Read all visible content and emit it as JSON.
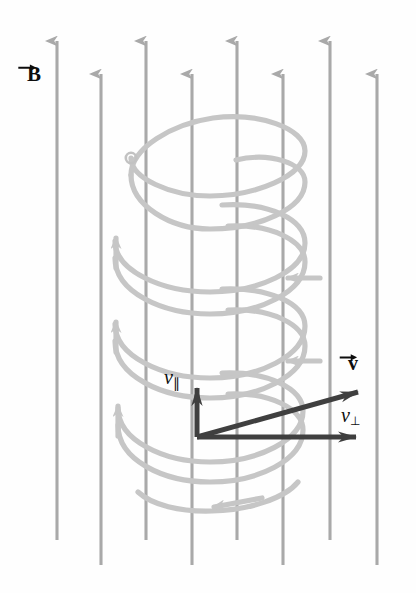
{
  "figure": {
    "background_color": "#fefefe"
  },
  "labels": {
    "magnetic_field": "B",
    "velocity": "v",
    "velocity_parallel_base": "v",
    "velocity_parallel_sub": "∥",
    "velocity_perp_base": "v",
    "velocity_perp_sub": "⊥"
  },
  "colors": {
    "field_line": "#a9a9a9",
    "helix": "#c6c6c6",
    "vector": "#3f3f3f",
    "label": "#0d0d0d",
    "particle": "#c2c2c2"
  },
  "field_lines": {
    "count": 8,
    "direction": "up",
    "x_positions": [
      57,
      101,
      146,
      192,
      237,
      283,
      330,
      377
    ],
    "tops": [
      35,
      68,
      35,
      68,
      35,
      68,
      35,
      68
    ],
    "bottoms": [
      540,
      565,
      540,
      565,
      540,
      565,
      540,
      565
    ]
  },
  "helix": {
    "turns": 4,
    "center_x": 210,
    "radius_x": 95,
    "radius_y": 30,
    "top_y": 175,
    "pitch": 83,
    "particle_dot": {
      "x": 131,
      "y": 158,
      "r": 5
    }
  },
  "vectors": {
    "origin": {
      "x": 197,
      "y": 437
    },
    "v_parallel": {
      "x": 197,
      "y": 378
    },
    "v_total": {
      "x": 372,
      "y": 388
    },
    "v_perp": {
      "x": 372,
      "y": 437
    }
  },
  "label_positions": {
    "magnetic_field": {
      "left": 27,
      "top": 62
    },
    "velocity": {
      "left": 348,
      "top": 352
    },
    "velocity_parallel": {
      "left": 164,
      "top": 366
    },
    "velocity_perp": {
      "left": 341,
      "top": 404
    }
  }
}
